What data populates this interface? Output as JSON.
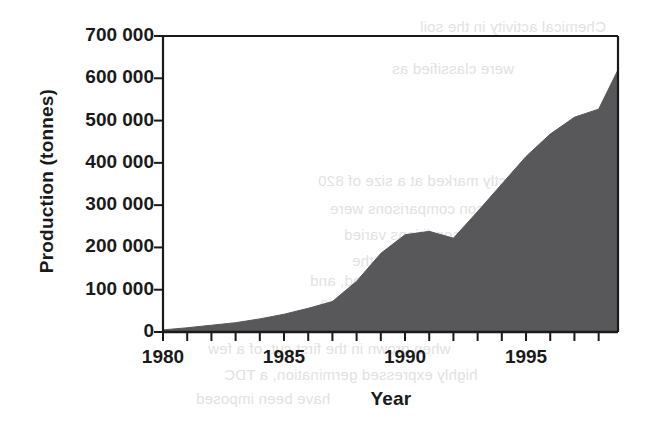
{
  "figure": {
    "background_color": "#ffffff",
    "ink_color": "#1a1a1a",
    "area_fill_color": "#58585a"
  },
  "chart_data": {
    "type": "area",
    "title": "",
    "xlabel": "Year",
    "ylabel": "Production (tonnes)",
    "xlim": [
      1980,
      1998.8
    ],
    "ylim": [
      0,
      700000
    ],
    "grid": false,
    "legend": "none",
    "x_tick_interval": 1,
    "x_labeled_ticks": [
      1980,
      1985,
      1990,
      1995
    ],
    "x_tick_labels": [
      "1980",
      "1985",
      "1990",
      "1995"
    ],
    "y_ticks": [
      0,
      100000,
      200000,
      300000,
      400000,
      500000,
      600000,
      700000
    ],
    "y_tick_labels": [
      "0",
      "100 000",
      "200 000",
      "300 000",
      "400 000",
      "500 000",
      "600 000",
      "700 000"
    ],
    "series": [
      {
        "name": "Production",
        "x": [
          1980,
          1981,
          1982,
          1983,
          1984,
          1985,
          1986,
          1987,
          1988,
          1989,
          1990,
          1991,
          1992,
          1993,
          1994,
          1995,
          1996,
          1997,
          1998,
          1998.8
        ],
        "values": [
          5000,
          10000,
          16000,
          22000,
          31000,
          42000,
          56000,
          72000,
          120000,
          186000,
          230000,
          238000,
          222000,
          285000,
          350000,
          415000,
          468000,
          508000,
          527000,
          620000
        ]
      }
    ]
  },
  "bleed_through_text": [
    {
      "text": "Chemical activity in the soil",
      "x": 420,
      "y": 18
    },
    {
      "text": "were classified as",
      "x": 392,
      "y": 60
    },
    {
      "text": "indistinctly marked at a size of 820",
      "x": 318,
      "y": 172
    },
    {
      "text": "season comparisons were",
      "x": 330,
      "y": 200
    },
    {
      "text": "conditions varied",
      "x": 344,
      "y": 226
    },
    {
      "text": "based on the",
      "x": 352,
      "y": 252
    },
    {
      "text": "season period, and",
      "x": 310,
      "y": 272
    },
    {
      "text": "had areas of 880",
      "x": 320,
      "y": 296
    },
    {
      "text": "when grown in the first cut, of a few",
      "x": 208,
      "y": 340
    },
    {
      "text": "highly expressed germination, a TDC",
      "x": 224,
      "y": 366
    },
    {
      "text": "have been imposed",
      "x": 196,
      "y": 390
    }
  ]
}
